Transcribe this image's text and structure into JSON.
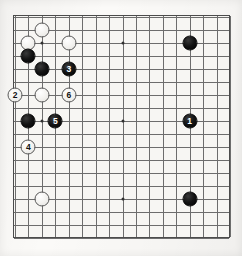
{
  "diagram": {
    "kind": "go-board-diagram",
    "title": "",
    "board": {
      "columns": 17,
      "rows": 18,
      "line_color": "#6d6d6d",
      "border_color": "#4c4c4c",
      "background_color": "#f7f6f3"
    },
    "colors": {
      "black_stone": "#000000",
      "white_stone": "#f2f1ee",
      "black_label": "#ffffff",
      "white_label": "#111111"
    },
    "star_points": [
      {
        "col": 2,
        "row": 2
      },
      {
        "col": 8,
        "row": 2
      },
      {
        "col": 2,
        "row": 8
      },
      {
        "col": 8,
        "row": 8
      },
      {
        "col": 2,
        "row": 14
      },
      {
        "col": 8,
        "row": 14
      }
    ],
    "stones": [
      {
        "color": "white",
        "label": "",
        "col": 2,
        "row": 1
      },
      {
        "color": "white",
        "label": "",
        "col": 1,
        "row": 2
      },
      {
        "color": "white",
        "label": "",
        "col": 4,
        "row": 2
      },
      {
        "color": "black",
        "label": "",
        "col": 1,
        "row": 3
      },
      {
        "color": "black",
        "label": "",
        "col": 2,
        "row": 4
      },
      {
        "color": "black",
        "label": "3",
        "col": 4,
        "row": 4
      },
      {
        "color": "white",
        "label": "2",
        "col": 0,
        "row": 6
      },
      {
        "color": "white",
        "label": "",
        "col": 2,
        "row": 6
      },
      {
        "color": "white",
        "label": "6",
        "col": 4,
        "row": 6
      },
      {
        "color": "black",
        "label": "",
        "col": 1,
        "row": 8
      },
      {
        "color": "black",
        "label": "5",
        "col": 3,
        "row": 8
      },
      {
        "color": "white",
        "label": "4",
        "col": 1,
        "row": 10
      },
      {
        "color": "white",
        "label": "",
        "col": 2,
        "row": 14
      },
      {
        "color": "black",
        "label": "",
        "col": 13,
        "row": 2
      },
      {
        "color": "black",
        "label": "1",
        "col": 13,
        "row": 8
      },
      {
        "color": "black",
        "label": "",
        "col": 13,
        "row": 14
      }
    ],
    "move_sequence": [
      {
        "number": 1,
        "color": "black"
      },
      {
        "number": 2,
        "color": "white"
      },
      {
        "number": 3,
        "color": "black"
      },
      {
        "number": 4,
        "color": "white"
      },
      {
        "number": 5,
        "color": "black"
      },
      {
        "number": 6,
        "color": "white"
      }
    ]
  }
}
